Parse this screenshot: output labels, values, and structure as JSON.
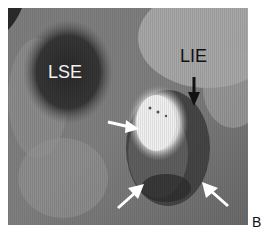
{
  "figure": {
    "panel_label": "B",
    "labels": {
      "lse": "LSE",
      "lie": "LIE"
    },
    "arrows": [
      {
        "name": "white-arrow-left",
        "color": "#ffffff",
        "direction": "right"
      },
      {
        "name": "white-arrow-bottom-left",
        "color": "#ffffff",
        "direction": "up-right"
      },
      {
        "name": "white-arrow-bottom-right",
        "color": "#ffffff",
        "direction": "up-left"
      },
      {
        "name": "black-arrow-lie",
        "color": "#111111",
        "direction": "down"
      }
    ]
  }
}
